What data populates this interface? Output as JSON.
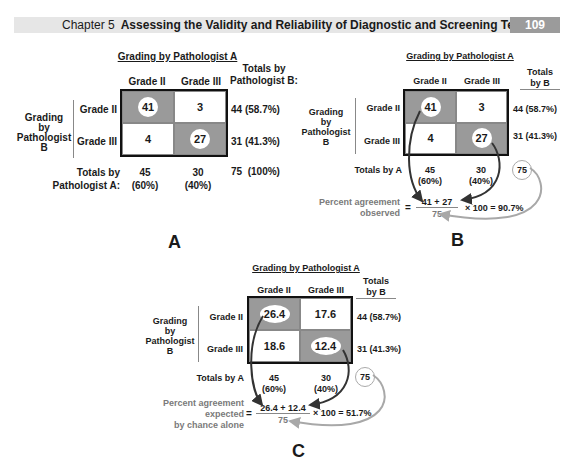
{
  "header": {
    "chapter": "Chapter 5",
    "title": "Assessing the Validity and Reliability of Diagnostic and Screening Tests",
    "page_number": "109"
  },
  "panel_a": {
    "letter": "A",
    "col_header": "Grading by Pathologist A",
    "cols": [
      "Grade II",
      "Grade III"
    ],
    "row_axis_label": [
      "Grading",
      "by",
      "Pathologist",
      "B"
    ],
    "rows": [
      "Grade II",
      "Grade III"
    ],
    "totals_header": [
      "Totals by",
      "Pathologist B:"
    ],
    "cells": [
      [
        "41",
        "3"
      ],
      [
        "4",
        "27"
      ]
    ],
    "row_totals": [
      "44 (58.7%)",
      "31 (41.3%)"
    ],
    "col_totals_label": [
      "Totals by",
      "Pathologist A:"
    ],
    "col_totals": [
      [
        "45",
        "(60%)"
      ],
      [
        "30",
        "(40%)"
      ]
    ],
    "grand_total": "75  (100%)"
  },
  "panel_b": {
    "letter": "B",
    "col_header": "Grading by Pathologist A",
    "cols": [
      "Grade II",
      "Grade III"
    ],
    "row_axis_label": [
      "Grading",
      "by",
      "Pathologist",
      "B"
    ],
    "rows": [
      "Grade II",
      "Grade III"
    ],
    "totals_header": [
      "Totals",
      "by B"
    ],
    "cells": [
      [
        "41",
        "3"
      ],
      [
        "4",
        "27"
      ]
    ],
    "row_totals": [
      "44 (58.7%)",
      "31 (41.3%)"
    ],
    "col_totals_label": "Totals by A",
    "col_totals": [
      [
        "45",
        "(60%)"
      ],
      [
        "30",
        "(40%)"
      ]
    ],
    "grand_total": "75",
    "formula": {
      "label": [
        "Percent agreement",
        "observed"
      ],
      "equals": "=",
      "numerator": "41 + 27",
      "denominator": "75",
      "result": "× 100 = 90.7%"
    }
  },
  "panel_c": {
    "letter": "C",
    "col_header": "Grading by Pathologist A",
    "cols": [
      "Grade II",
      "Grade III"
    ],
    "row_axis_label": [
      "Grading",
      "by",
      "Pathologist",
      "B"
    ],
    "rows": [
      "Grade II",
      "Grade III"
    ],
    "totals_header": [
      "Totals",
      "by B"
    ],
    "cells": [
      [
        "26.4",
        "17.6"
      ],
      [
        "18.6",
        "12.4"
      ]
    ],
    "row_totals": [
      "44 (58.7%)",
      "31 (41.3%)"
    ],
    "col_totals_label": "Totals by A",
    "col_totals": [
      [
        "45",
        "(60%)"
      ],
      [
        "30",
        "(40%)"
      ]
    ],
    "grand_total": "75",
    "formula": {
      "label": [
        "Percent agreement",
        "expected",
        "by chance alone"
      ],
      "equals": "=",
      "numerator": "26.4 + 12.4",
      "denominator": "75",
      "result": "× 100 = 51.7%"
    }
  },
  "colors": {
    "shaded_cell": "#9a9a9a",
    "header_bar": "#e6e6e6",
    "page_box": "#9b9b9b",
    "arrow_dark": "#333333",
    "arrow_light": "#a8a8a8"
  }
}
